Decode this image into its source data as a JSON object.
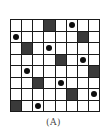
{
  "figure": {
    "caption": "(A)",
    "grid_size": 8,
    "colors": {
      "line": "#1a1a1a",
      "dark_cell": "#3a3a3a",
      "light_cell": "#ffffff",
      "dot": "#0d0d0d"
    },
    "rows": [
      {
        "dark": 3,
        "dot": 5
      },
      {
        "dark": 6,
        "dot": 0
      },
      {
        "dark": 1,
        "dot": 3
      },
      {
        "dark": 4,
        "dot": 6
      },
      {
        "dark": 7,
        "dot": 1
      },
      {
        "dark": 2,
        "dot": 4
      },
      {
        "dark": 5,
        "dot": 7
      },
      {
        "dark": 0,
        "dot": 2
      }
    ]
  }
}
